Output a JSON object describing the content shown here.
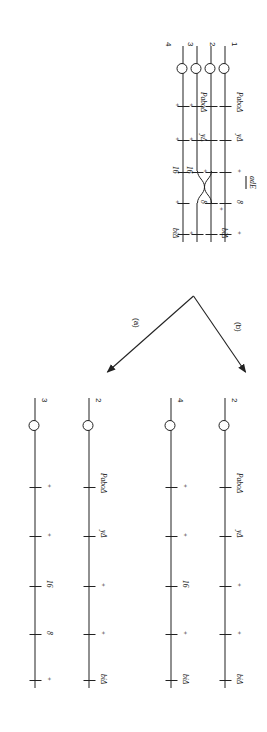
{
  "figure": {
    "type": "genetics-crossing-over-diagram",
    "marker_plus": "+",
    "panels": [
      {
        "id": "parental",
        "label": "",
        "chromatids": [
          {
            "id": "1",
            "end_number": "1",
            "has_centromere": true,
            "loci": [
              {
                "name": "PaboΔ",
                "shown": true
              },
              {
                "name": "yΔ",
                "shown": true
              },
              {
                "name": "+",
                "shown": true
              },
              {
                "name": "8",
                "shown": true
              },
              {
                "name": "+",
                "shown": true
              }
            ]
          },
          {
            "id": "2",
            "end_number": "2",
            "has_centromere": true,
            "loci": [
              {
                "name": "PaboΔ",
                "shown": true
              },
              {
                "name": "yΔ",
                "shown": true
              },
              {
                "name": "+",
                "shown": true
              },
              {
                "name": "8",
                "shown": true
              },
              {
                "name": "+",
                "shown": true
              }
            ]
          },
          {
            "id": "3",
            "end_number": "3",
            "has_centromere": true,
            "loci": [
              {
                "name": "+",
                "shown": true
              },
              {
                "name": "+",
                "shown": true
              },
              {
                "name": "16",
                "shown": true
              },
              {
                "name": "+",
                "shown": true
              },
              {
                "name": "biΔ",
                "shown": true
              }
            ]
          },
          {
            "id": "4",
            "end_number": "4",
            "has_centromere": true,
            "loci": [
              {
                "name": "+",
                "shown": true
              },
              {
                "name": "+",
                "shown": true
              },
              {
                "name": "16",
                "shown": true
              },
              {
                "name": "+",
                "shown": true
              },
              {
                "name": "biΔ",
                "shown": true
              }
            ]
          }
        ],
        "region_label": "adE"
      },
      {
        "id": "product-a",
        "label": "(a)",
        "chromatids": [
          {
            "id": "a2",
            "end_number": "2",
            "has_centromere": true,
            "loci": [
              {
                "name": "PaboΔ",
                "shown": true
              },
              {
                "name": "yΔ",
                "shown": true
              },
              {
                "name": "+",
                "shown": true
              },
              {
                "name": "+",
                "shown": true
              },
              {
                "name": "biΔ",
                "shown": true
              }
            ]
          },
          {
            "id": "a3",
            "end_number": "3",
            "has_centromere": true,
            "loci": [
              {
                "name": "+",
                "shown": true
              },
              {
                "name": "+",
                "shown": true
              },
              {
                "name": "16",
                "shown": true
              },
              {
                "name": "8",
                "shown": true
              },
              {
                "name": "+",
                "shown": true
              }
            ]
          }
        ]
      },
      {
        "id": "product-b",
        "label": "(b)",
        "chromatids": [
          {
            "id": "b2",
            "end_number": "2",
            "has_centromere": true,
            "loci": [
              {
                "name": "PaboΔ",
                "shown": true
              },
              {
                "name": "yΔ",
                "shown": true
              },
              {
                "name": "+",
                "shown": true
              },
              {
                "name": "+",
                "shown": true
              },
              {
                "name": "biΔ",
                "shown": true
              }
            ]
          },
          {
            "id": "b4",
            "end_number": "4",
            "has_centromere": true,
            "loci": [
              {
                "name": "+",
                "shown": true
              },
              {
                "name": "+",
                "shown": true
              },
              {
                "name": "16",
                "shown": true
              },
              {
                "name": "+",
                "shown": true
              },
              {
                "name": "biΔ",
                "shown": true
              }
            ]
          }
        ]
      }
    ],
    "labels": {
      "adE": "adE",
      "pabo": "PaboΔ",
      "y": "yΔ",
      "bi": "biΔ",
      "n8": "8",
      "n16": "16",
      "plus": "+",
      "num1": "1",
      "num2": "2",
      "num3": "3",
      "num4": "4",
      "branch_a": "(a)",
      "branch_b": "(b)"
    },
    "colors": {
      "ink": "#222222",
      "background": "#ffffff"
    }
  }
}
